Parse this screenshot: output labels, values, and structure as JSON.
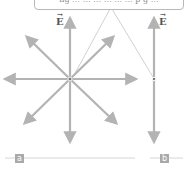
{
  "callout": {
    "text": "ng … … … … … … p g …"
  },
  "labels": {
    "field_a": "E",
    "field_b": "E",
    "vector_mark": "→"
  },
  "panels": [
    {
      "tag": "a",
      "description": "field lines radiating from a point charge"
    },
    {
      "tag": "b",
      "description": "uniform vertical field line through a point"
    }
  ],
  "colors": {
    "arrow": "#b3b3b3",
    "tag_bg": "#a9a9a9",
    "rule": "#cccccc",
    "dot": "#777777"
  }
}
